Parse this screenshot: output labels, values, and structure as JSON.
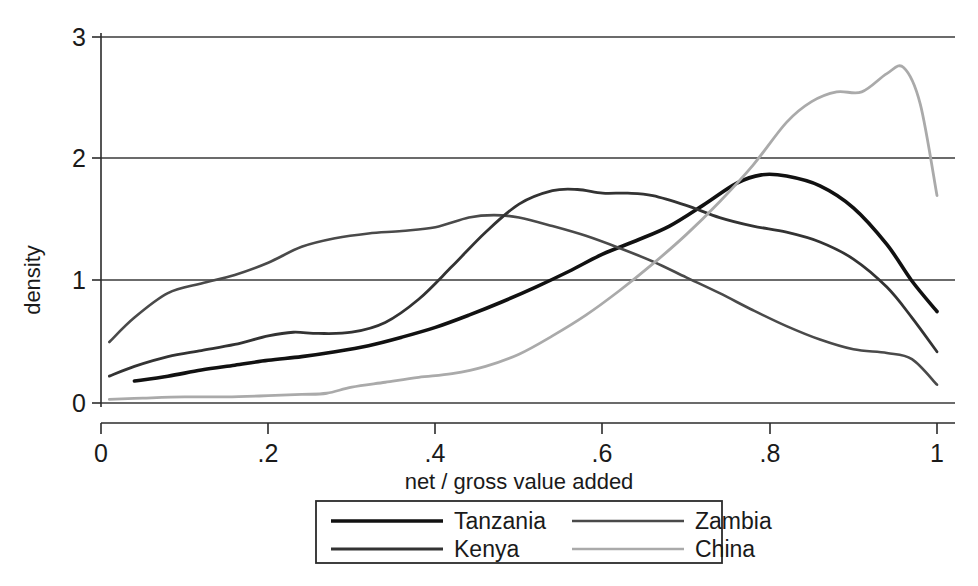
{
  "chart_data": {
    "type": "line",
    "title": "",
    "subtitle": "",
    "xlabel": "net / gross value added",
    "ylabel": "density",
    "xlim": [
      0,
      1
    ],
    "ylim": [
      0,
      3
    ],
    "xticks": [
      "0",
      ".2",
      ".4",
      ".6",
      ".8",
      "1"
    ],
    "xtick_values": [
      0,
      0.2,
      0.4,
      0.6,
      0.8,
      1
    ],
    "yticks": [
      "0",
      "1",
      "2",
      "3"
    ],
    "ytick_values": [
      0,
      1,
      2,
      3
    ],
    "grid": "horizontal",
    "legend_position": "bottom-center",
    "series": [
      {
        "name": "Tanzania",
        "color": "#111111",
        "width": 3.6,
        "x": [
          0.04,
          0.08,
          0.12,
          0.16,
          0.2,
          0.24,
          0.28,
          0.32,
          0.36,
          0.4,
          0.44,
          0.48,
          0.52,
          0.56,
          0.6,
          0.64,
          0.68,
          0.72,
          0.76,
          0.79,
          0.82,
          0.86,
          0.9,
          0.94,
          0.97,
          1.0
        ],
        "y": [
          0.18,
          0.22,
          0.27,
          0.31,
          0.35,
          0.38,
          0.42,
          0.47,
          0.54,
          0.62,
          0.72,
          0.83,
          0.95,
          1.08,
          1.22,
          1.33,
          1.45,
          1.62,
          1.8,
          1.87,
          1.86,
          1.78,
          1.6,
          1.3,
          1.0,
          0.75
        ]
      },
      {
        "name": "Zambia",
        "color": "#4a4a4a",
        "width": 2.6,
        "x": [
          0.01,
          0.04,
          0.08,
          0.12,
          0.16,
          0.2,
          0.24,
          0.28,
          0.32,
          0.36,
          0.4,
          0.44,
          0.47,
          0.5,
          0.54,
          0.58,
          0.62,
          0.66,
          0.7,
          0.74,
          0.78,
          0.82,
          0.86,
          0.9,
          0.94,
          0.97,
          1.0
        ],
        "y": [
          0.5,
          0.7,
          0.9,
          0.98,
          1.05,
          1.15,
          1.28,
          1.35,
          1.39,
          1.41,
          1.44,
          1.52,
          1.54,
          1.52,
          1.45,
          1.37,
          1.27,
          1.16,
          1.03,
          0.9,
          0.76,
          0.63,
          0.52,
          0.44,
          0.41,
          0.36,
          0.15
        ]
      },
      {
        "name": "Kenya",
        "color": "#333333",
        "width": 2.8,
        "x": [
          0.01,
          0.04,
          0.08,
          0.12,
          0.16,
          0.2,
          0.23,
          0.26,
          0.3,
          0.34,
          0.38,
          0.42,
          0.46,
          0.5,
          0.54,
          0.57,
          0.6,
          0.63,
          0.66,
          0.7,
          0.74,
          0.78,
          0.82,
          0.86,
          0.9,
          0.94,
          0.97,
          1.0
        ],
        "y": [
          0.22,
          0.3,
          0.38,
          0.43,
          0.48,
          0.55,
          0.58,
          0.57,
          0.58,
          0.66,
          0.85,
          1.12,
          1.4,
          1.63,
          1.74,
          1.75,
          1.72,
          1.72,
          1.7,
          1.62,
          1.52,
          1.45,
          1.4,
          1.32,
          1.18,
          0.95,
          0.7,
          0.42
        ]
      },
      {
        "name": "China",
        "color": "#aaaaaa",
        "width": 2.8,
        "x": [
          0.01,
          0.05,
          0.1,
          0.15,
          0.2,
          0.24,
          0.27,
          0.3,
          0.34,
          0.38,
          0.42,
          0.46,
          0.5,
          0.54,
          0.58,
          0.62,
          0.66,
          0.7,
          0.74,
          0.78,
          0.82,
          0.85,
          0.88,
          0.91,
          0.94,
          0.96,
          0.98,
          1.0
        ],
        "y": [
          0.03,
          0.04,
          0.05,
          0.05,
          0.06,
          0.07,
          0.08,
          0.13,
          0.17,
          0.21,
          0.24,
          0.3,
          0.4,
          0.55,
          0.72,
          0.92,
          1.14,
          1.38,
          1.65,
          1.95,
          2.3,
          2.47,
          2.55,
          2.55,
          2.7,
          2.75,
          2.45,
          1.7
        ]
      }
    ]
  },
  "legend": {
    "entries": [
      {
        "label": "Tanzania"
      },
      {
        "label": "Zambia"
      },
      {
        "label": "Kenya"
      },
      {
        "label": "China"
      }
    ]
  }
}
